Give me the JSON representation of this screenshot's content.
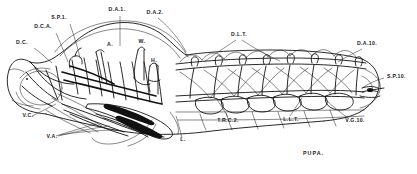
{
  "figure": {
    "title": "PUPA.",
    "caption": "PUPA.",
    "line_color": "#111111",
    "background_color": "#ffffff"
  },
  "labels": {
    "dc": {
      "text": "D.C.",
      "x": 22,
      "y": 44
    },
    "dca": {
      "text": "D.C.A.",
      "x": 43,
      "y": 28
    },
    "sp1": {
      "text": "S.P.1.",
      "x": 57,
      "y": 19
    },
    "da1": {
      "text": "D.A.1.",
      "x": 110,
      "y": 11
    },
    "da2": {
      "text": "D.A.2.",
      "x": 150,
      "y": 13
    },
    "dlt": {
      "text": "D.L.T.",
      "x": 228,
      "y": 36
    },
    "da10": {
      "text": "D.A.10.",
      "x": 358,
      "y": 44
    },
    "sp10": {
      "text": "S.P.10.",
      "x": 387,
      "y": 77
    },
    "vgjo": {
      "text": "V.G.10.",
      "x": 341,
      "y": 122
    },
    "llt": {
      "text": "L.L.T.",
      "x": 283,
      "y": 120
    },
    "trc2": {
      "text": "T.R.C.2.",
      "x": 221,
      "y": 121
    },
    "l": {
      "text": "L.",
      "x": 179,
      "y": 140
    },
    "va": {
      "text": "V.A.",
      "x": 50,
      "y": 138
    },
    "vc": {
      "text": "V.C.",
      "x": 24,
      "y": 117
    },
    "a": {
      "text": "A.",
      "x": 108,
      "y": 45
    },
    "w": {
      "text": "W.",
      "x": 144,
      "y": 42
    },
    "h": {
      "text": "H.",
      "x": 152,
      "y": 61
    }
  },
  "structures": {
    "dorsal_longitudinal_trunk": "D.L.T.",
    "lateral_longitudinal_trunk": "L.L.T.",
    "dorsal_air_sac_1": "D.A.1.",
    "dorsal_air_sac_2": "D.A.2.",
    "dorsal_air_sac_10": "D.A.10.",
    "spiracle_1": "S.P.1.",
    "spiracle_10": "S.P.10.",
    "dorsal_cephalic": "D.C.",
    "dorsal_cephalic_anterior": "D.C.A.",
    "ventral_cephalic": "V.C.",
    "ventral_air_sac": "V.A.",
    "ventral_ganglion_10": "V.G.10.",
    "transverse_commissure_2": "T.R.C.2.",
    "leg": "L.",
    "antenna": "A.",
    "wing": "W.",
    "head": "H."
  },
  "segments": {
    "count": 8,
    "spiracle_count": 8
  }
}
